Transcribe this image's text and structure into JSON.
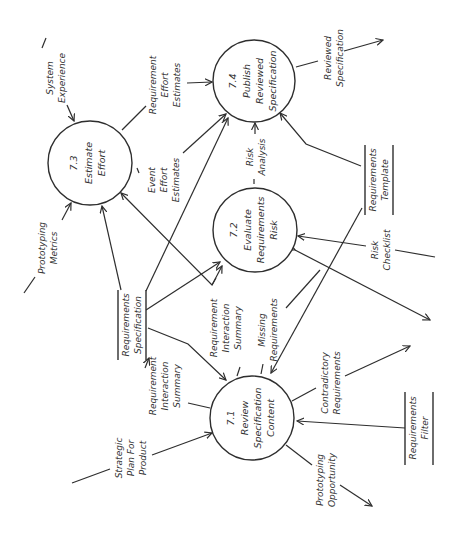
{
  "diagram": {
    "type": "data-flow-diagram",
    "orientation": "rotated-90-ccw",
    "colors": {
      "line": "#2e2e2e",
      "text": "#333333",
      "background": "#ffffff"
    },
    "processes": [
      {
        "id": "7.1",
        "number": "7.1",
        "lines": [
          "Review",
          "Specification",
          "Content"
        ]
      },
      {
        "id": "7.2",
        "number": "7.2",
        "lines": [
          "Evaluate",
          "Requirements",
          "Risk"
        ]
      },
      {
        "id": "7.3",
        "number": "7.3",
        "lines": [
          "Estimate",
          "Effort"
        ]
      },
      {
        "id": "7.4",
        "number": "7.4",
        "lines": [
          "Publish",
          "Reviewed",
          "Specification"
        ]
      }
    ],
    "stores": [
      {
        "id": "req-spec",
        "lines": [
          "Requirements",
          "Specification"
        ]
      },
      {
        "id": "req-template",
        "lines": [
          "Requirements",
          "Template"
        ]
      },
      {
        "id": "req-filter",
        "lines": [
          "Requirements",
          "Filter"
        ]
      }
    ],
    "flows": [
      {
        "id": "system-experience",
        "lines": [
          "System",
          "Experience"
        ]
      },
      {
        "id": "prototyping-metrics",
        "lines": [
          "Prototyping",
          "Metrics"
        ]
      },
      {
        "id": "req-effort-estimates",
        "lines": [
          "Requirement",
          "Effort",
          "Estimates"
        ]
      },
      {
        "id": "event-effort-estimates",
        "lines": [
          "Event",
          "Effort",
          "Estimates"
        ]
      },
      {
        "id": "reviewed-specification",
        "lines": [
          "Reviewed",
          "Specification"
        ]
      },
      {
        "id": "risk-analysis",
        "lines": [
          "Risk",
          "Analysis"
        ]
      },
      {
        "id": "risk-checklist",
        "lines": [
          "Risk",
          "Checklist"
        ]
      },
      {
        "id": "req-interaction-summary-a",
        "lines": [
          "Requirement",
          "Interaction",
          "Summary"
        ]
      },
      {
        "id": "req-interaction-summary-b",
        "lines": [
          "Requirement",
          "Interaction",
          "Summary"
        ]
      },
      {
        "id": "missing-requirements",
        "lines": [
          "Missing",
          "Requirements"
        ]
      },
      {
        "id": "strategic-plan",
        "lines": [
          "Strategic",
          "Plan For",
          "Product"
        ]
      },
      {
        "id": "contradictory-requirements",
        "lines": [
          "Contradictory",
          "Requirements"
        ]
      },
      {
        "id": "prototyping-opportunity",
        "lines": [
          "Prototyping",
          "Opportunity"
        ]
      }
    ]
  }
}
